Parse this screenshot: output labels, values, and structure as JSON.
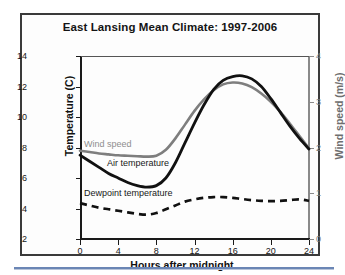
{
  "figure": {
    "title": "East Lansing Mean Climate: 1997-2006",
    "colors": {
      "air_temperature": "#111111",
      "dewpoint_temperature": "#111111",
      "wind_speed": "#7e7e7e",
      "right_axis": "#8a8a8a",
      "frame": "#3a3a3a",
      "bottom_rule": "#6b86b5"
    }
  },
  "chart_data": {
    "type": "line",
    "title": "East Lansing Mean Climate: 1997-2006",
    "xlabel": "Hours after midnight",
    "ylabel": "Temperature (C)",
    "y2label": "Wind speed (m/s)",
    "xlim": [
      0,
      24
    ],
    "ylim": [
      2,
      14
    ],
    "y2lim": [
      0,
      4
    ],
    "xticks": [
      0,
      4,
      8,
      12,
      16,
      20,
      24
    ],
    "yticks": [
      2,
      4,
      6,
      8,
      10,
      12,
      14
    ],
    "y2ticks": [
      0,
      1,
      2,
      3,
      4
    ],
    "grid": false,
    "legend_position": "inline-annotations",
    "x": [
      0,
      1,
      2,
      3,
      4,
      5,
      6,
      7,
      8,
      9,
      10,
      11,
      12,
      13,
      14,
      15,
      16,
      17,
      18,
      19,
      20,
      21,
      22,
      23,
      24
    ],
    "series": [
      {
        "name": "Air temperature",
        "axis": "left",
        "units": "C",
        "style": "solid",
        "color": "#111111",
        "values": [
          7.5,
          7.1,
          6.7,
          6.3,
          6.0,
          5.7,
          5.5,
          5.4,
          5.5,
          6.0,
          7.0,
          8.3,
          9.6,
          10.8,
          11.8,
          12.4,
          12.65,
          12.7,
          12.5,
          12.0,
          11.2,
          10.3,
          9.4,
          8.6,
          7.9
        ]
      },
      {
        "name": "Dewpoint temperature",
        "axis": "left",
        "units": "C",
        "style": "dashed",
        "color": "#111111",
        "values": [
          4.35,
          4.2,
          4.05,
          3.95,
          3.85,
          3.75,
          3.65,
          3.6,
          3.7,
          3.95,
          4.2,
          4.45,
          4.6,
          4.7,
          4.75,
          4.75,
          4.7,
          4.62,
          4.55,
          4.5,
          4.48,
          4.5,
          4.55,
          4.6,
          4.5
        ]
      },
      {
        "name": "Wind speed",
        "axis": "right",
        "units": "m/s",
        "style": "solid",
        "color": "#7e7e7e",
        "values": [
          1.93,
          1.9,
          1.87,
          1.85,
          1.83,
          1.82,
          1.81,
          1.8,
          1.82,
          1.95,
          2.2,
          2.5,
          2.8,
          3.05,
          3.25,
          3.38,
          3.42,
          3.4,
          3.32,
          3.18,
          3.0,
          2.78,
          2.52,
          2.25,
          1.98
        ]
      }
    ],
    "annotations": [
      {
        "text": "Wind speed",
        "series": "Wind speed"
      },
      {
        "text": "Air temperature",
        "series": "Air temperature"
      },
      {
        "text": "Dewpoint temperature",
        "series": "Dewpoint temperature"
      }
    ]
  }
}
